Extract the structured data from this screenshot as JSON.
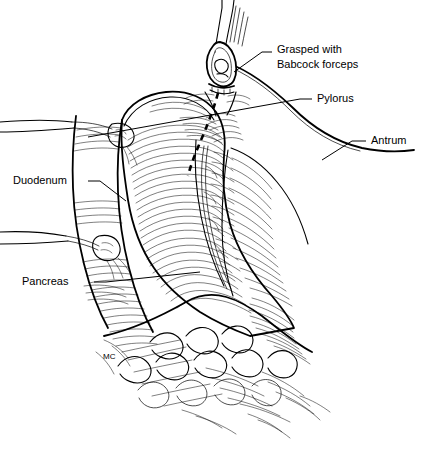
{
  "figure": {
    "background_color": "#ffffff",
    "ink_color": "#000000",
    "signature": "MC",
    "width": 426,
    "height": 453
  },
  "labels": [
    {
      "id": "grasped",
      "line1": "Grasped with",
      "line2": "Babcock forceps",
      "x": 277,
      "y": 50
    },
    {
      "id": "pylorus",
      "line1": "Pylorus",
      "line2": "",
      "x": 317,
      "y": 99
    },
    {
      "id": "antrum",
      "line1": "Antrum",
      "line2": "",
      "x": 371,
      "y": 141
    },
    {
      "id": "duodenum",
      "line1": "Duodenum",
      "line2": "",
      "x": 13,
      "y": 181
    },
    {
      "id": "pancreas",
      "line1": "Pancreas",
      "line2": "",
      "x": 22,
      "y": 282
    }
  ],
  "anatomy": {
    "parts": [
      "duodenum",
      "pylorus",
      "antrum",
      "pancreas",
      "greater-omentum",
      "babcock-forceps",
      "incision-line"
    ]
  }
}
